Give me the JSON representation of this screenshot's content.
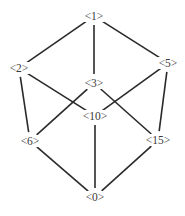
{
  "diagram": {
    "type": "lattice",
    "nodes": [
      {
        "id": "1",
        "label": "<1>",
        "x": 94,
        "y": 16
      },
      {
        "id": "2",
        "label": "<2>",
        "x": 19,
        "y": 68
      },
      {
        "id": "5",
        "label": "<5>",
        "x": 168,
        "y": 63
      },
      {
        "id": "3",
        "label": "<3>",
        "x": 94,
        "y": 83
      },
      {
        "id": "10",
        "label": "<10>",
        "x": 95,
        "y": 116
      },
      {
        "id": "6",
        "label": "<6>",
        "x": 30,
        "y": 141
      },
      {
        "id": "15",
        "label": "<15>",
        "x": 158,
        "y": 140
      },
      {
        "id": "0",
        "label": "<0>",
        "x": 95,
        "y": 197
      }
    ],
    "edges": [
      {
        "from": "1",
        "to": "2"
      },
      {
        "from": "1",
        "to": "3"
      },
      {
        "from": "1",
        "to": "5"
      },
      {
        "from": "2",
        "to": "6"
      },
      {
        "from": "2",
        "to": "10"
      },
      {
        "from": "5",
        "to": "10"
      },
      {
        "from": "5",
        "to": "15"
      },
      {
        "from": "3",
        "to": "6"
      },
      {
        "from": "3",
        "to": "15"
      },
      {
        "from": "6",
        "to": "0"
      },
      {
        "from": "10",
        "to": "0"
      },
      {
        "from": "15",
        "to": "0"
      }
    ]
  }
}
